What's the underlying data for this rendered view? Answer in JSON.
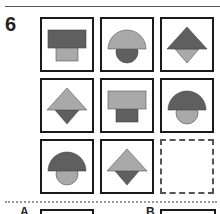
{
  "question": {
    "number": "6"
  },
  "colors": {
    "dark": "#5f5f5f",
    "light": "#a9a9a9",
    "border": "#1a1a1a"
  },
  "grid": [
    {
      "row": 1,
      "col": 1,
      "shape": "rect-over-small-rect",
      "top": "dark",
      "bottom": "light"
    },
    {
      "row": 1,
      "col": 2,
      "shape": "semicircle-over-circle",
      "top": "light",
      "bottom": "dark"
    },
    {
      "row": 1,
      "col": 3,
      "shape": "triangle-over-inverted-triangle",
      "top": "dark",
      "bottom": "light"
    },
    {
      "row": 2,
      "col": 1,
      "shape": "triangle-over-inverted-triangle",
      "top": "light",
      "bottom": "dark"
    },
    {
      "row": 2,
      "col": 2,
      "shape": "rect-over-small-rect",
      "top": "light",
      "bottom": "dark"
    },
    {
      "row": 2,
      "col": 3,
      "shape": "semicircle-over-circle",
      "top": "dark",
      "bottom": "light"
    },
    {
      "row": 3,
      "col": 1,
      "shape": "semicircle-over-circle",
      "top": "dark",
      "bottom": "light"
    },
    {
      "row": 3,
      "col": 2,
      "shape": "triangle-over-inverted-triangle",
      "top": "light",
      "bottom": "dark"
    },
    {
      "row": 3,
      "col": 3,
      "shape": "empty-answer-slot"
    }
  ],
  "options": [
    {
      "label": "A"
    },
    {
      "label": "B"
    }
  ]
}
